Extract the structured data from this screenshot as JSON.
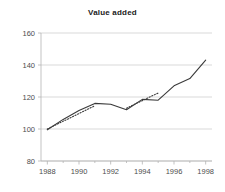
{
  "chart_data": {
    "type": "line",
    "title": "Value added",
    "xlabel": "",
    "ylabel": "",
    "xlim": [
      1987.6,
      1998.4
    ],
    "ylim": [
      80,
      160
    ],
    "grid": true,
    "legend": "none",
    "y_ticks": [
      80,
      100,
      120,
      140,
      160
    ],
    "x_ticks": [
      1988,
      1990,
      1992,
      1994,
      1996,
      1998
    ],
    "x_minor_ticks": [
      1989,
      1991,
      1993,
      1995,
      1997
    ],
    "x": [
      1988,
      1989,
      1990,
      1991,
      1992,
      1993,
      1994,
      1995,
      1996,
      1997,
      1998
    ],
    "series": [
      {
        "name": "Value added index",
        "style": "solid",
        "values": [
          99.5,
          106,
          111.5,
          116,
          115.5,
          112,
          118.5,
          118,
          127,
          131.5,
          143
        ]
      },
      {
        "name": "Trend 1988-1991",
        "style": "dotted",
        "x": [
          1988,
          1991
        ],
        "values": [
          100,
          114.5
        ]
      },
      {
        "name": "Trend 1993-1995",
        "style": "dotted",
        "x": [
          1993,
          1995
        ],
        "values": [
          113,
          122.5
        ]
      }
    ],
    "colors": {
      "line": "#3a3a3a",
      "grid": "#c8c8c8",
      "axis": "#b4b4b4",
      "text": "#4d4d4d",
      "title": "#1a1a1a",
      "background": "#ffffff"
    }
  }
}
